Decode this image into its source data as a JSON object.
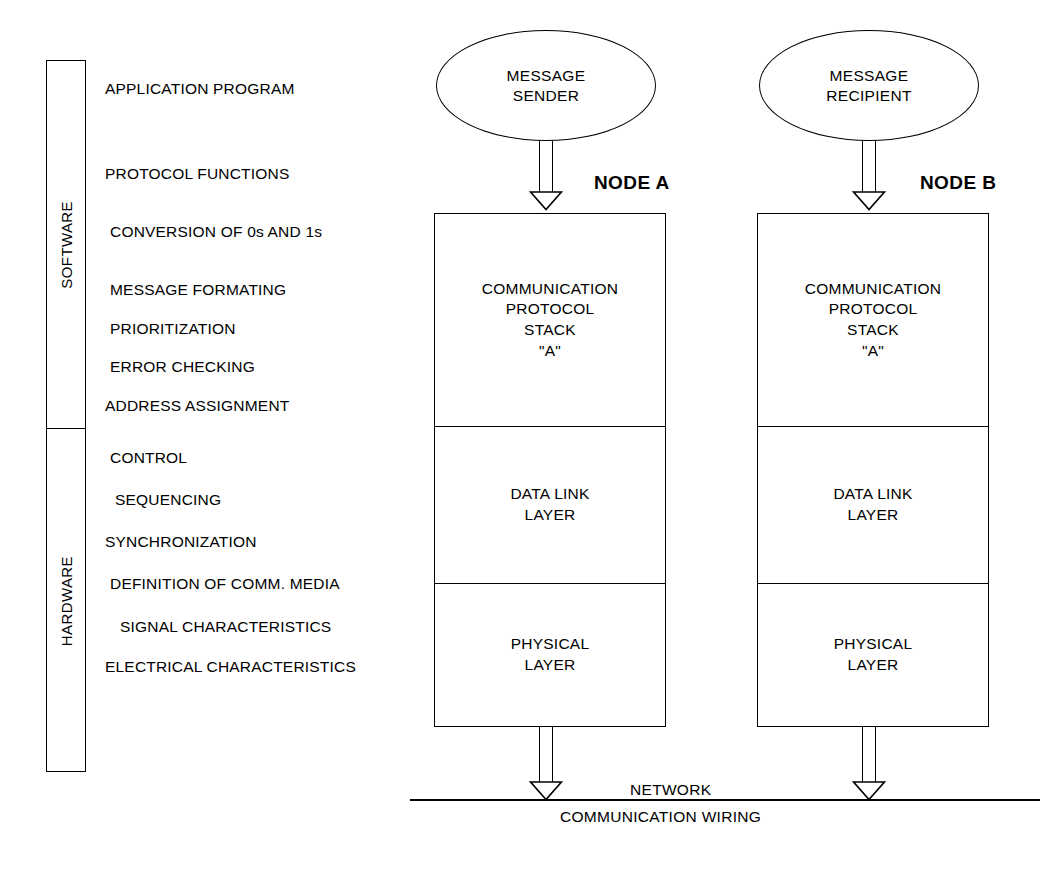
{
  "bracket": {
    "software_label": "SOFTWARE",
    "hardware_label": "HARDWARE"
  },
  "functions": [
    {
      "label": "APPLICATION PROGRAM",
      "x": 105,
      "y": 80
    },
    {
      "label": "PROTOCOL FUNCTIONS",
      "x": 105,
      "y": 165
    },
    {
      "label": "CONVERSION OF 0s AND 1s",
      "x": 110,
      "y": 223
    },
    {
      "label": "MESSAGE FORMATING",
      "x": 110,
      "y": 281
    },
    {
      "label": "PRIORITIZATION",
      "x": 110,
      "y": 320
    },
    {
      "label": "ERROR CHECKING",
      "x": 110,
      "y": 358
    },
    {
      "label": "ADDRESS ASSIGNMENT",
      "x": 105,
      "y": 397
    },
    {
      "label": "CONTROL",
      "x": 110,
      "y": 449
    },
    {
      "label": "SEQUENCING",
      "x": 115,
      "y": 491
    },
    {
      "label": "SYNCHRONIZATION",
      "x": 105,
      "y": 533
    },
    {
      "label": "DEFINITION OF COMM. MEDIA",
      "x": 110,
      "y": 575
    },
    {
      "label": "SIGNAL CHARACTERISTICS",
      "x": 120,
      "y": 618
    },
    {
      "label": "ELECTRICAL CHARACTERISTICS",
      "x": 105,
      "y": 658
    }
  ],
  "nodes": [
    {
      "title": "NODE A",
      "endpoint_line1": "MESSAGE",
      "endpoint_line2": "SENDER",
      "layers": [
        {
          "lines": [
            "COMMUNICATION",
            "PROTOCOL",
            "STACK",
            "\"A\""
          ]
        },
        {
          "lines": [
            "DATA LINK",
            "LAYER"
          ]
        },
        {
          "lines": [
            "PHYSICAL",
            "LAYER"
          ]
        }
      ]
    },
    {
      "title": "NODE B",
      "endpoint_line1": "MESSAGE",
      "endpoint_line2": "RECIPIENT",
      "layers": [
        {
          "lines": [
            "COMMUNICATION",
            "PROTOCOL",
            "STACK",
            "\"A\""
          ]
        },
        {
          "lines": [
            "DATA LINK",
            "LAYER"
          ]
        },
        {
          "lines": [
            "PHYSICAL",
            "LAYER"
          ]
        }
      ]
    }
  ],
  "network": {
    "label": "NETWORK",
    "wiring_label": "COMMUNICATION WIRING"
  },
  "colors": {
    "stroke": "#000000",
    "background": "#ffffff"
  }
}
